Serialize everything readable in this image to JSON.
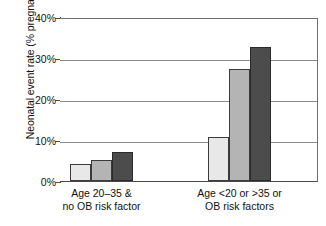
{
  "chart_data": {
    "type": "bar",
    "title": "",
    "xlabel": "",
    "ylabel": "Neonatal event rate (% pregnancies)",
    "ylim": [
      0,
      40
    ],
    "ytick_values": [
      40,
      30,
      20,
      10,
      0
    ],
    "ytick_labels": [
      "40%",
      "30%",
      "20%",
      "10%",
      "0%"
    ],
    "grid": true,
    "legend": "none",
    "categories": [
      "Age 20–35 & no OB risk factor",
      "Age <20 or >35 or OB risk factors"
    ],
    "category_label_lines": [
      [
        "Age 20–35 &",
        "no OB risk factor"
      ],
      [
        "Age <20 or >35 or",
        "OB risk factors"
      ]
    ],
    "series": [
      {
        "name": "series-1",
        "shade": "light",
        "color": "#e8e8e8",
        "values": [
          4.1,
          10.7
        ]
      },
      {
        "name": "series-2",
        "shade": "medium",
        "color": "#b4b4b4",
        "values": [
          5.1,
          27.3
        ]
      },
      {
        "name": "series-3",
        "shade": "dark",
        "color": "#4c4c4c",
        "values": [
          7.1,
          32.7
        ]
      }
    ]
  },
  "axis": {
    "ticks": [
      {
        "label": "40%",
        "value": 40
      },
      {
        "label": "30%",
        "value": 30
      },
      {
        "label": "20%",
        "value": 20
      },
      {
        "label": "10%",
        "value": 10
      },
      {
        "label": "0%",
        "value": 0
      }
    ],
    "y_title": "Neonatal event rate (% pregnancies)"
  },
  "colors": {
    "axis": "#4a4a4a",
    "gridline": "#8b8b8b",
    "bar_outline": "#3a3a3a",
    "background": "#ffffff"
  }
}
